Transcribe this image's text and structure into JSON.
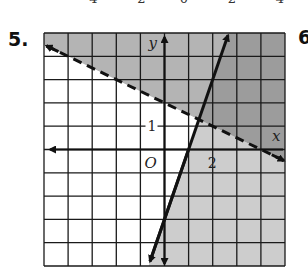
{
  "page": {
    "problem_number": "5.",
    "next_problem_number": "6",
    "previous_graph_tick_labels": [
      "−4",
      "−2",
      "0",
      "2",
      "4"
    ]
  },
  "colors": {
    "overlap_region": "#9c9c9c",
    "dashed_only_region": "#b4b4b4",
    "solid_only_region": "#cdcdcd",
    "unshaded_region": "#ffffff",
    "grid": "#1a1a1a",
    "lines": "#111111"
  },
  "chart_data": {
    "type": "line",
    "title": "",
    "xlabel": "x",
    "ylabel": "y",
    "xlim": [
      -5,
      5
    ],
    "ylim": [
      -5,
      5
    ],
    "grid": true,
    "grid_step": 1,
    "origin_label": "O",
    "tick_labels": {
      "x": [
        {
          "value": 2,
          "label": "2"
        }
      ],
      "y": [
        {
          "value": 1,
          "label": "1"
        }
      ]
    },
    "series": [
      {
        "name": "dashed boundary",
        "equation": "y = -1/2 x + 2",
        "style": "dashed",
        "slope": -0.5,
        "intercept": 2,
        "shading": "above",
        "points": [
          [
            -5,
            4.5
          ],
          [
            0,
            2
          ],
          [
            5,
            -0.5
          ]
        ]
      },
      {
        "name": "solid boundary",
        "equation": "y = 3x - 3",
        "style": "solid",
        "slope": 3,
        "intercept": -3,
        "shading": "right (below line)",
        "points": [
          [
            -0.67,
            -5
          ],
          [
            1,
            0
          ],
          [
            2.67,
            5
          ]
        ]
      }
    ],
    "intersection": [
      1.43,
      1.29
    ],
    "system": [
      "y > -1/2 x + 2",
      "y ≤ 3x - 3"
    ]
  }
}
